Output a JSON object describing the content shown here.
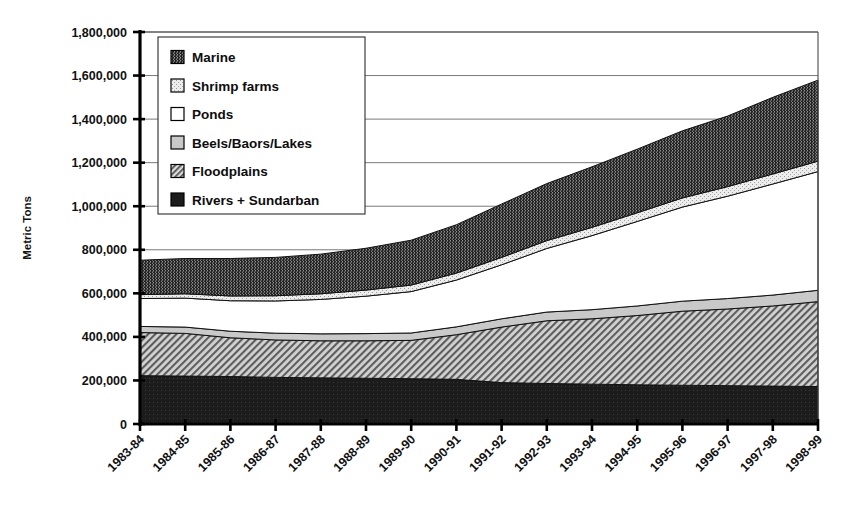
{
  "chart_data": {
    "type": "area",
    "title": "",
    "subtitle": "",
    "xlabel": "",
    "ylabel": "Metric Tons",
    "stacked": true,
    "grid": true,
    "legend_position": "top-left-inside",
    "ylim": [
      0,
      1800000
    ],
    "ytick_step": 200000,
    "ytick_labels": [
      "0",
      "200,000",
      "400,000",
      "600,000",
      "800,000",
      "1,000,000",
      "1,200,000",
      "1,400,000",
      "1,600,000",
      "1,800,000"
    ],
    "ytick_values": [
      0,
      200000,
      400000,
      600000,
      800000,
      1000000,
      1200000,
      1400000,
      1600000,
      1800000
    ],
    "categories": [
      "1983-84",
      "1984-85",
      "1985-86",
      "1986-87",
      "1987-88",
      "1988-89",
      "1989-90",
      "1990-91",
      "1991-92",
      "1992-93",
      "1993-94",
      "1994-95",
      "1995-96",
      "1996-97",
      "1997-98",
      "1998-99"
    ],
    "series": [
      {
        "name": "Rivers + Sundarban",
        "pattern": "solid-dark",
        "color": "#1a1a1a",
        "values": [
          222000,
          220000,
          218000,
          214000,
          212000,
          210000,
          208000,
          205000,
          190000,
          186000,
          183000,
          180000,
          178000,
          176000,
          174000,
          172000
        ]
      },
      {
        "name": "Floodplains",
        "pattern": "diagonal-hatch",
        "color": "#b4b4b4",
        "values": [
          198000,
          196000,
          178000,
          172000,
          170000,
          172000,
          176000,
          205000,
          255000,
          288000,
          300000,
          318000,
          340000,
          352000,
          368000,
          390000
        ]
      },
      {
        "name": "Beels/Baors/Lakes",
        "pattern": "light-gray",
        "color": "#c9c9c9",
        "values": [
          28000,
          29000,
          30000,
          31000,
          32000,
          33000,
          34000,
          36000,
          38000,
          40000,
          42000,
          44000,
          46000,
          48000,
          50000,
          52000
        ]
      },
      {
        "name": "Ponds",
        "pattern": "white",
        "color": "#ffffff",
        "values": [
          128000,
          133000,
          140000,
          148000,
          158000,
          172000,
          190000,
          215000,
          248000,
          292000,
          340000,
          388000,
          432000,
          470000,
          510000,
          545000
        ]
      },
      {
        "name": "Shrimp farms",
        "pattern": "light-speckle",
        "color": "#e2e2e2",
        "values": [
          18000,
          20000,
          22000,
          24000,
          26000,
          28000,
          30000,
          32000,
          34000,
          36000,
          38000,
          40000,
          42000,
          44000,
          46000,
          48000
        ]
      },
      {
        "name": "Marine",
        "pattern": "dark-vertical-hatch",
        "color": "#2b2b2b",
        "values": [
          158000,
          162000,
          172000,
          176000,
          182000,
          192000,
          206000,
          222000,
          245000,
          262000,
          278000,
          292000,
          308000,
          324000,
          352000,
          372000
        ]
      }
    ],
    "stack_order_bottom_to_top": [
      "Rivers + Sundarban",
      "Floodplains",
      "Beels/Baors/Lakes",
      "Ponds",
      "Shrimp farms",
      "Marine"
    ],
    "totals": [
      752000,
      760000,
      760000,
      765000,
      780000,
      807000,
      844000,
      915000,
      1010000,
      1104000,
      1181000,
      1262000,
      1346000,
      1414000,
      1500000,
      1579000
    ]
  },
  "legend": {
    "items": [
      {
        "label": "Marine",
        "swatch": "dark-vertical-hatch"
      },
      {
        "label": "Shrimp farms",
        "swatch": "light-speckle"
      },
      {
        "label": "Ponds",
        "swatch": "white"
      },
      {
        "label": "Beels/Baors/Lakes",
        "swatch": "light-gray"
      },
      {
        "label": "Floodplains",
        "swatch": "diagonal-hatch"
      },
      {
        "label": "Rivers + Sundarban",
        "swatch": "solid-dark"
      }
    ]
  },
  "axes": {
    "y_title": "Metric Tons"
  }
}
